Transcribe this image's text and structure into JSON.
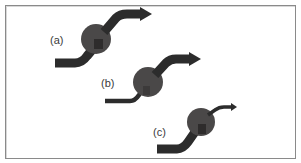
{
  "figure": {
    "panels": [
      {
        "id": "a",
        "label": "(a)",
        "description": "thick input, thick output",
        "input_width": "thick",
        "output_width": "thick"
      },
      {
        "id": "b",
        "label": "(b)",
        "description": "thin input, thick output",
        "input_width": "thin",
        "output_width": "thick"
      },
      {
        "id": "c",
        "label": "(c)",
        "description": "thick input, thin output",
        "input_width": "thick",
        "output_width": "thin"
      }
    ],
    "colors": {
      "arrow": "#2c2c2c",
      "node": "#4a4848",
      "node_inner": "#3a3838",
      "frame_border": "#8a8a8a",
      "background": "#ffffff",
      "label": "#3a3a3a"
    }
  }
}
